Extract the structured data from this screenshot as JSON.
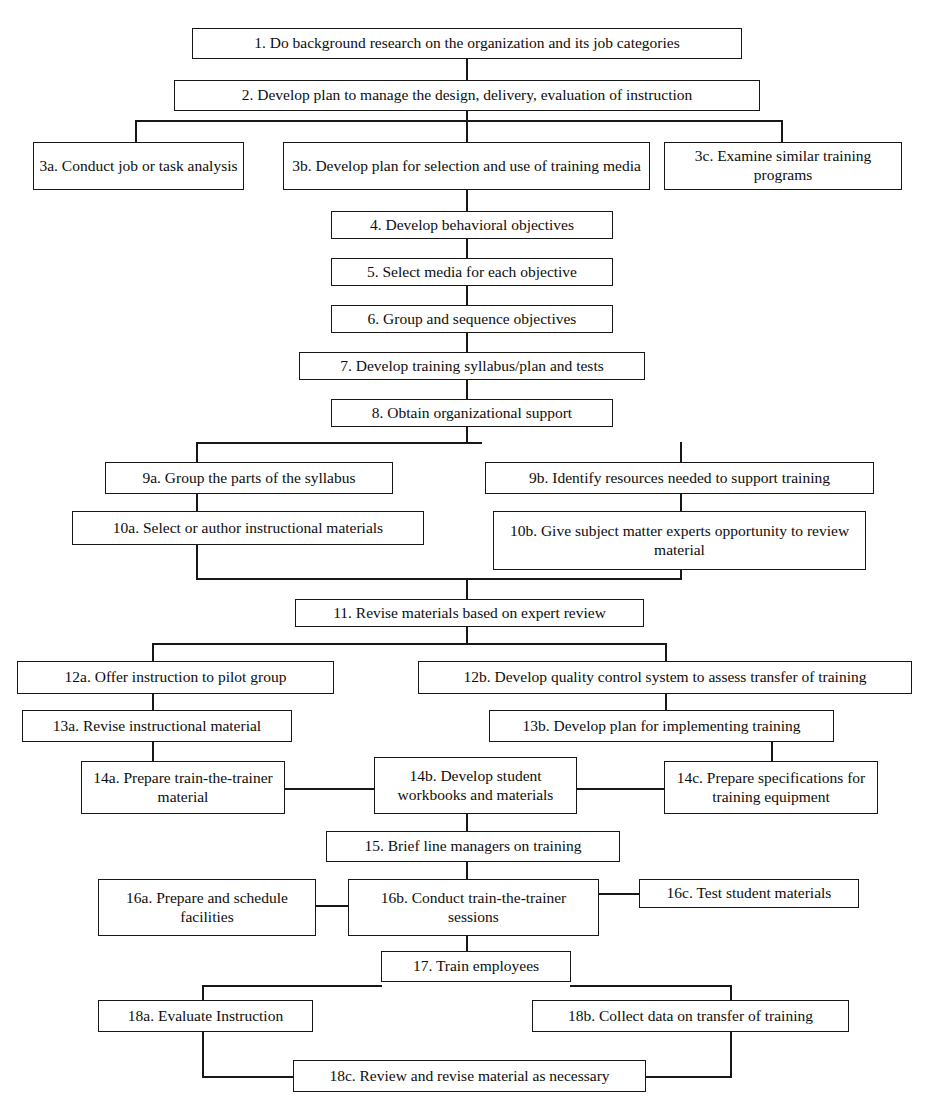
{
  "diagram": {
    "type": "flowchart",
    "orientation": "top-to-bottom",
    "node_style": {
      "border_color": "#171717",
      "fill_color": "#ffffff",
      "text_color": "#0d0d0d"
    },
    "nodes": [
      {
        "id": "n1",
        "label": "1. Do background research on the organization and its job categories"
      },
      {
        "id": "n2",
        "label": "2. Develop plan to manage the design, delivery, evaluation of instruction"
      },
      {
        "id": "n3a",
        "label": "3a. Conduct job or task analysis"
      },
      {
        "id": "n3b",
        "label": "3b. Develop plan for selection and use of training media"
      },
      {
        "id": "n3c",
        "label": "3c. Examine similar training programs"
      },
      {
        "id": "n4",
        "label": "4. Develop behavioral objectives"
      },
      {
        "id": "n5",
        "label": "5. Select media for each objective"
      },
      {
        "id": "n6",
        "label": "6. Group and sequence objectives"
      },
      {
        "id": "n7",
        "label": "7. Develop training syllabus/plan and tests"
      },
      {
        "id": "n8",
        "label": "8. Obtain organizational support"
      },
      {
        "id": "n9a",
        "label": "9a. Group the parts of the syllabus"
      },
      {
        "id": "n9b",
        "label": "9b. Identify resources needed to support training"
      },
      {
        "id": "n10a",
        "label": "10a. Select or author instructional materials"
      },
      {
        "id": "n10b",
        "label": "10b. Give subject matter experts opportunity to review material"
      },
      {
        "id": "n11",
        "label": "11. Revise materials based on expert review"
      },
      {
        "id": "n12a",
        "label": "12a. Offer instruction to pilot group"
      },
      {
        "id": "n12b",
        "label": "12b. Develop quality control system to assess transfer of training"
      },
      {
        "id": "n13a",
        "label": "13a. Revise instructional material"
      },
      {
        "id": "n13b",
        "label": "13b. Develop plan for implementing training"
      },
      {
        "id": "n14a",
        "label": "14a. Prepare train-the-trainer material"
      },
      {
        "id": "n14b",
        "label": "14b. Develop student workbooks and materials"
      },
      {
        "id": "n14c",
        "label": "14c. Prepare specifications for training equipment"
      },
      {
        "id": "n15",
        "label": "15. Brief line managers on training"
      },
      {
        "id": "n16a",
        "label": "16a. Prepare and schedule facilities"
      },
      {
        "id": "n16b",
        "label": "16b. Conduct train-the-trainer sessions"
      },
      {
        "id": "n16c",
        "label": "16c. Test student materials"
      },
      {
        "id": "n17",
        "label": "17. Train employees"
      },
      {
        "id": "n18a",
        "label": "18a. Evaluate Instruction"
      },
      {
        "id": "n18b",
        "label": "18b. Collect data on transfer of training"
      },
      {
        "id": "n18c",
        "label": "18c. Review and revise material as necessary"
      }
    ],
    "edges": [
      {
        "from": "n1",
        "to": "n2"
      },
      {
        "from": "n2",
        "to": "n3a"
      },
      {
        "from": "n2",
        "to": "n3b"
      },
      {
        "from": "n2",
        "to": "n3c"
      },
      {
        "from": "n3b",
        "to": "n4"
      },
      {
        "from": "n4",
        "to": "n5"
      },
      {
        "from": "n5",
        "to": "n6"
      },
      {
        "from": "n6",
        "to": "n7"
      },
      {
        "from": "n7",
        "to": "n8"
      },
      {
        "from": "n8",
        "to": "n9a"
      },
      {
        "from": "n8",
        "to": "n9b"
      },
      {
        "from": "n9a",
        "to": "n10a"
      },
      {
        "from": "n9b",
        "to": "n10b"
      },
      {
        "from": "n10a",
        "to": "n11"
      },
      {
        "from": "n10b",
        "to": "n11"
      },
      {
        "from": "n11",
        "to": "n12a"
      },
      {
        "from": "n11",
        "to": "n12b"
      },
      {
        "from": "n12a",
        "to": "n13a"
      },
      {
        "from": "n12b",
        "to": "n13b"
      },
      {
        "from": "n13a",
        "to": "n14a"
      },
      {
        "from": "n13b",
        "to": "n14c"
      },
      {
        "from": "n14a",
        "to": "n14b"
      },
      {
        "from": "n14c",
        "to": "n14b"
      },
      {
        "from": "n14b",
        "to": "n15"
      },
      {
        "from": "n15",
        "to": "n16b"
      },
      {
        "from": "n16a",
        "to": "n16b"
      },
      {
        "from": "n16c",
        "to": "n16b"
      },
      {
        "from": "n16b",
        "to": "n17"
      },
      {
        "from": "n17",
        "to": "n18a"
      },
      {
        "from": "n17",
        "to": "n18b"
      },
      {
        "from": "n18a",
        "to": "n18c"
      },
      {
        "from": "n18b",
        "to": "n18c"
      }
    ]
  }
}
